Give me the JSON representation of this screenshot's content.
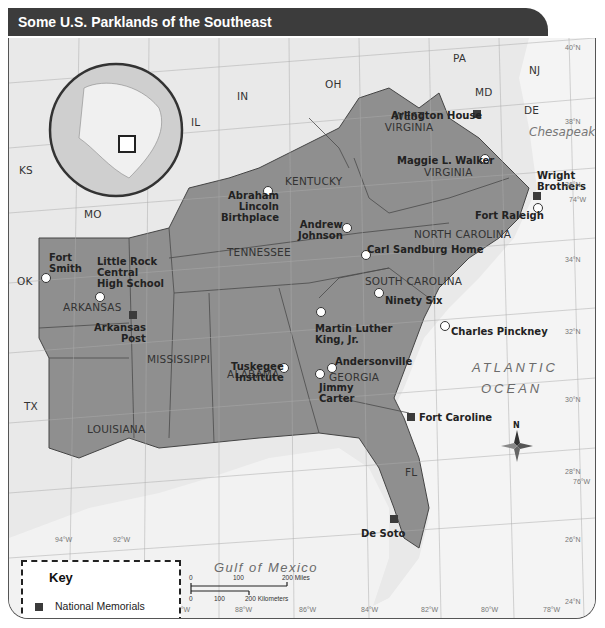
{
  "title": "Some U.S. Parklands of the Southeast",
  "states": {
    "PA": "PA",
    "NJ": "NJ",
    "MD": "MD",
    "DE": "DE",
    "OH": "OH",
    "IN": "IN",
    "IL": "IL",
    "KS": "KS",
    "MO": "MO",
    "OK": "OK",
    "TX": "TX",
    "WV": "WEST VIRGINIA",
    "VA": "VIRGINIA",
    "KY": "KENTUCKY",
    "TN": "TENNESSEE",
    "NC": "NORTH CAROLINA",
    "SC": "SOUTH CAROLINA",
    "AR": "ARKANSAS",
    "MS": "MISSISSIPPI",
    "AL": "ALABAMA",
    "GA": "GEORGIA",
    "LA": "LOUISIANA",
    "FL": "FL"
  },
  "water": {
    "chesapeake": "Chesapeake Bay",
    "atlantic1": "ATLANTIC",
    "atlantic2": "OCEAN",
    "gulf": "Gulf of Mexico"
  },
  "sites": {
    "memorials": [
      "Arlington House",
      "Wright Brothers",
      "Arkansas Post",
      "Fort Caroline",
      "De Soto"
    ],
    "historic": [
      "Maggie L. Walker",
      "Fort Raleigh",
      "Abraham Lincoln Birthplace",
      "Andrew Johnson",
      "Carl Sandburg Home",
      "Fort Smith",
      "Little Rock Central High School",
      "Ninety Six",
      "Martin Luther King, Jr.",
      "Charles Pinckney",
      "Tuskegee Institute",
      "Andersonville",
      "Jimmy Carter"
    ]
  },
  "labels": {
    "arlington": "Arlington House",
    "wright1": "Wright",
    "wright2": "Brothers",
    "arkpost1": "Arkansas",
    "arkpost2": "Post",
    "fortcaroline": "Fort Caroline",
    "desoto": "De Soto",
    "maggie": "Maggie L. Walker",
    "raleigh": "Fort Raleigh",
    "lincoln1": "Abraham",
    "lincoln2": "Lincoln",
    "lincoln3": "Birthplace",
    "johnson1": "Andrew",
    "johnson2": "Johnson",
    "sandburg": "Carl Sandburg Home",
    "smith1": "Fort",
    "smith2": "Smith",
    "lr1": "Little Rock",
    "lr2": "Central",
    "lr3": "High School",
    "ninetysix": "Ninety Six",
    "mlk1": "Martin Luther",
    "mlk2": "King, Jr.",
    "pinckney": "Charles Pinckney",
    "tuskegee1": "Tuskegee",
    "tuskegee2": "Institute",
    "andersonville": "Andersonville",
    "carter1": "Jimmy",
    "carter2": "Carter"
  },
  "compass": {
    "north": "N"
  },
  "latitudes": [
    "40°N",
    "38°N",
    "36°N",
    "34°N",
    "32°N",
    "30°N",
    "28°N",
    "26°N",
    "24°N"
  ],
  "longitudes": [
    "94°W",
    "92°W",
    "90°W",
    "88°W",
    "86°W",
    "84°W",
    "82°W",
    "80°W",
    "78°W",
    "76°W",
    "74°W"
  ],
  "key": {
    "title": "Key",
    "memorials": "National Memorials",
    "historic": "National Historic Sites"
  },
  "scale": {
    "m0": "0",
    "m100": "100",
    "m200": "200 Miles",
    "k0": "0",
    "k100": "100",
    "k200": "200 Kilometers"
  },
  "colors": {
    "region": "#8f8f8f",
    "land": "#e3e3e3",
    "water": "#f3f3f3",
    "title_bar": "#3c3c3c"
  }
}
